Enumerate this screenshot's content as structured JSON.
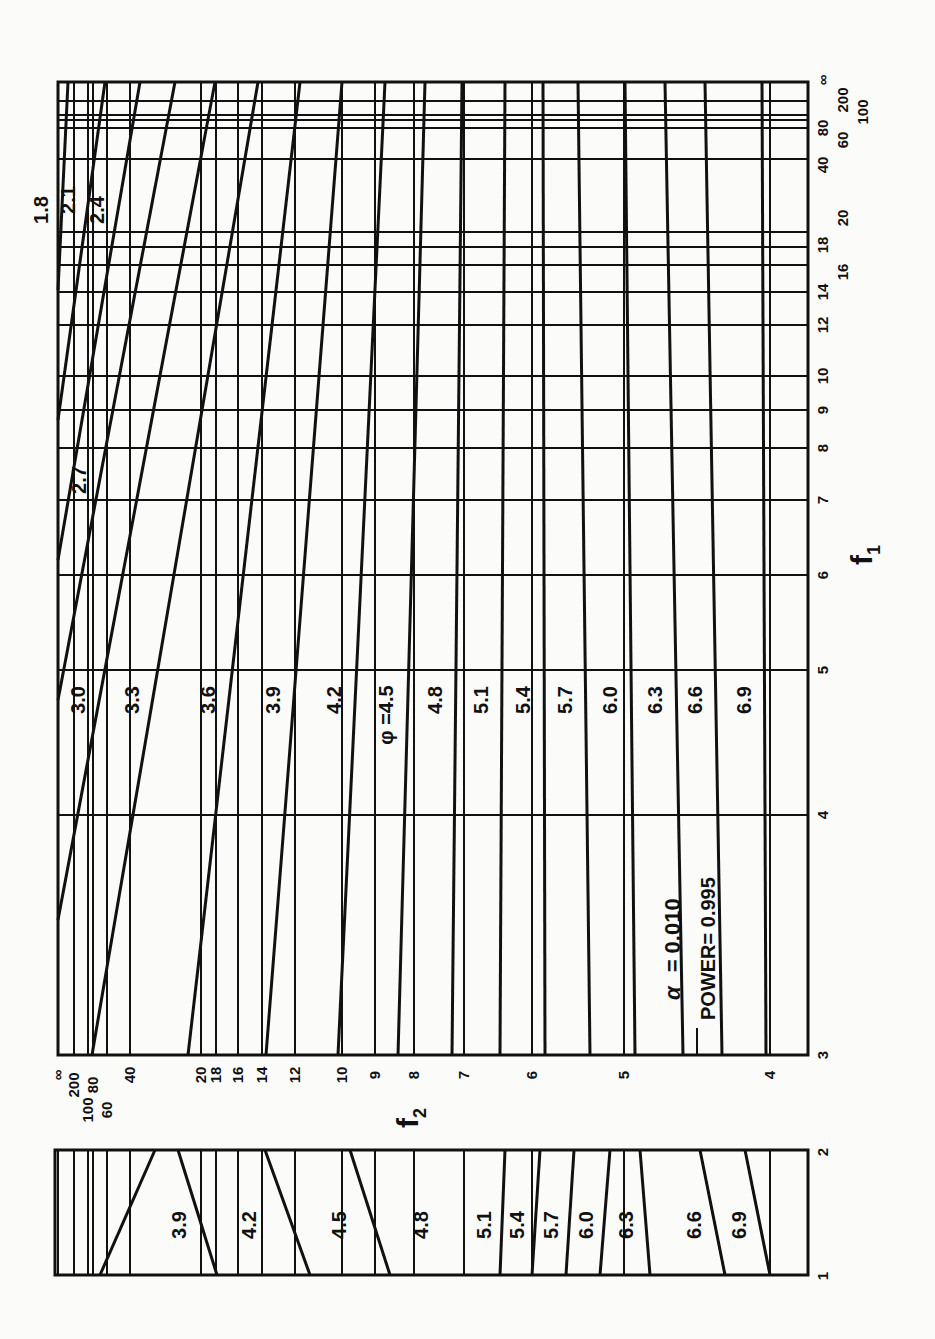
{
  "chart_data": [
    {
      "type": "line",
      "title": "Power chart (main panel)",
      "annotation": {
        "alpha_label": "α = 0.010",
        "power_label": "POWER= 0.995"
      },
      "xlabel": "f1",
      "ylabel": "f2",
      "f1_ticks": [
        "3",
        "4",
        "5",
        "6",
        "7",
        "8",
        "9",
        "10",
        "12",
        "14",
        "16",
        "18",
        "20",
        "40",
        "60",
        "80",
        "100",
        "200",
        "∞"
      ],
      "f2_ticks": [
        "∞",
        "200",
        "100",
        "80",
        "60",
        "40",
        "20",
        "18",
        "16",
        "14",
        "12",
        "10",
        "9",
        "8",
        "7",
        "6",
        "5",
        "4"
      ],
      "curve_label_prefix": "φ =",
      "series": [
        {
          "name": "1.8",
          "top_x": 68,
          "bottom_x": 58,
          "bottom_y": 290
        },
        {
          "name": "2.1",
          "top_x": 105,
          "bottom_x": 58,
          "bottom_y": 420
        },
        {
          "name": "2.4",
          "top_x": 140,
          "bottom_x": 58,
          "bottom_y": 560
        },
        {
          "name": "2.7",
          "top_x": 175,
          "bottom_x": 58,
          "bottom_y": 700
        },
        {
          "name": "3.0",
          "top_x": 215,
          "bottom_x": 58,
          "bottom_y": 920
        },
        {
          "name": "3.3",
          "top_x": 258,
          "bottom_x": 92,
          "bottom_y": 1055
        },
        {
          "name": "3.6",
          "top_x": 300,
          "bottom_x": 188,
          "bottom_y": 1055
        },
        {
          "name": "3.9",
          "top_x": 342,
          "bottom_x": 266,
          "bottom_y": 1055
        },
        {
          "name": "4.2",
          "top_x": 385,
          "bottom_x": 338,
          "bottom_y": 1055
        },
        {
          "name": "4.5",
          "top_x": 425,
          "bottom_x": 398,
          "bottom_y": 1055
        },
        {
          "name": "4.8",
          "top_x": 462,
          "bottom_x": 452,
          "bottom_y": 1055
        },
        {
          "name": "5.1",
          "top_x": 505,
          "bottom_x": 500,
          "bottom_y": 1055
        },
        {
          "name": "5.4",
          "top_x": 543,
          "bottom_x": 545,
          "bottom_y": 1055
        },
        {
          "name": "5.7",
          "top_x": 578,
          "bottom_x": 590,
          "bottom_y": 1055
        },
        {
          "name": "6.0",
          "top_x": 625,
          "bottom_x": 635,
          "bottom_y": 1055
        },
        {
          "name": "6.3",
          "top_x": 665,
          "bottom_x": 683,
          "bottom_y": 1055
        },
        {
          "name": "6.6",
          "top_x": 705,
          "bottom_x": 722,
          "bottom_y": 1055
        },
        {
          "name": "6.9",
          "top_x": 762,
          "bottom_x": 766,
          "bottom_y": 1055
        }
      ]
    },
    {
      "type": "line",
      "title": "Power chart (lower panel, f1 = 1 to 2)",
      "f1_ticks": [
        "1",
        "2"
      ],
      "series": [
        {
          "name": "3.9",
          "x1": 295,
          "x2": 195
        },
        {
          "name": "4.2",
          "x1": 267,
          "x2": 195
        },
        {
          "name": "4.5",
          "x1": 360,
          "x2": 258
        },
        {
          "name": "4.8",
          "x1": 440,
          "x2": 300
        },
        {
          "name": "5.1",
          "x1": 501,
          "x2": 335
        },
        {
          "name": "5.4",
          "x1": 532,
          "x2": 370
        },
        {
          "name": "5.7",
          "x1": 566,
          "x2": 400
        },
        {
          "name": "6.0",
          "x1": 600,
          "x2": 460
        },
        {
          "name": "6.3",
          "x1": 650,
          "x2": 620
        },
        {
          "name": "6.6",
          "x1": 725,
          "x2": 700
        },
        {
          "name": "6.9",
          "x1": 765,
          "x2": 750
        }
      ]
    }
  ],
  "labels": {
    "f1": "f",
    "f1_sub": "1",
    "f2": "f",
    "f2_sub": "2",
    "alpha": "α",
    "alpha_value": "= 0.010",
    "power": "POWER= 0.995",
    "phi_prefix": "φ ="
  }
}
